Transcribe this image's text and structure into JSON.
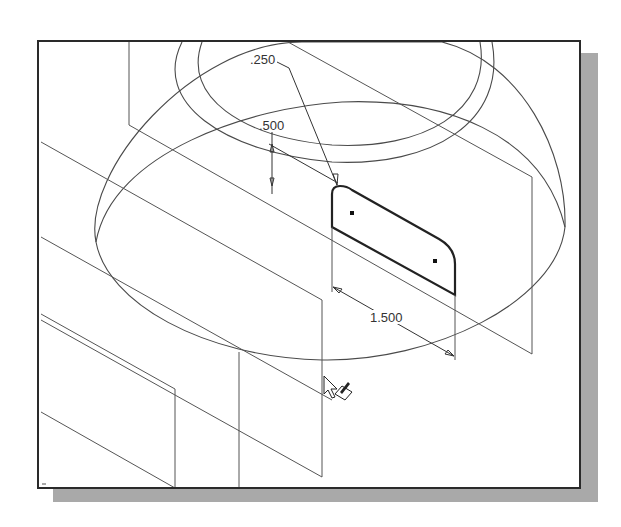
{
  "viewport": {
    "background": "#ffffff",
    "border_color": "#2a2a2a",
    "shadow_color": "#a9a9a9"
  },
  "dimensions": {
    "fillet_radius": ".250",
    "height": ".500",
    "length": "1.500"
  },
  "sketch": {
    "profile_color": "#222222",
    "construction_color": "#555555"
  },
  "cursor": {
    "icon": "select-with-sketch-pencil-cursor"
  }
}
